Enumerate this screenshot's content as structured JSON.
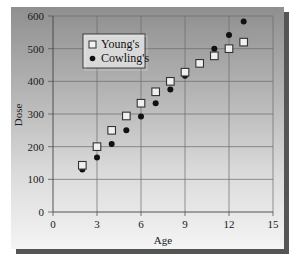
{
  "chart_data": {
    "type": "scatter",
    "title": "",
    "xlabel": "Age",
    "ylabel": "Dose",
    "xlim": [
      0,
      15
    ],
    "ylim": [
      0,
      600
    ],
    "xticks": [
      0,
      3,
      6,
      9,
      12,
      15
    ],
    "yticks": [
      0,
      100,
      200,
      300,
      400,
      500,
      600
    ],
    "grid": true,
    "legend_position": "upper-left",
    "series": [
      {
        "name": "Young's",
        "marker": "square-open",
        "x": [
          2,
          3,
          4,
          5,
          6,
          7,
          8,
          9,
          10,
          11,
          12,
          13
        ],
        "y": [
          143,
          200,
          250,
          294,
          333,
          368,
          400,
          428,
          455,
          478,
          500,
          520
        ]
      },
      {
        "name": "Cowling's",
        "marker": "circle-filled",
        "x": [
          2,
          3,
          4,
          5,
          6,
          7,
          8,
          9,
          10,
          11,
          12,
          13
        ],
        "y": [
          130,
          167,
          208,
          250,
          292,
          333,
          375,
          417,
          458,
          500,
          542,
          583
        ]
      }
    ]
  },
  "legend": {
    "items": [
      "Young's",
      "Cowling's"
    ]
  },
  "axes": {
    "x_label": "Age",
    "y_label": "Dose"
  }
}
